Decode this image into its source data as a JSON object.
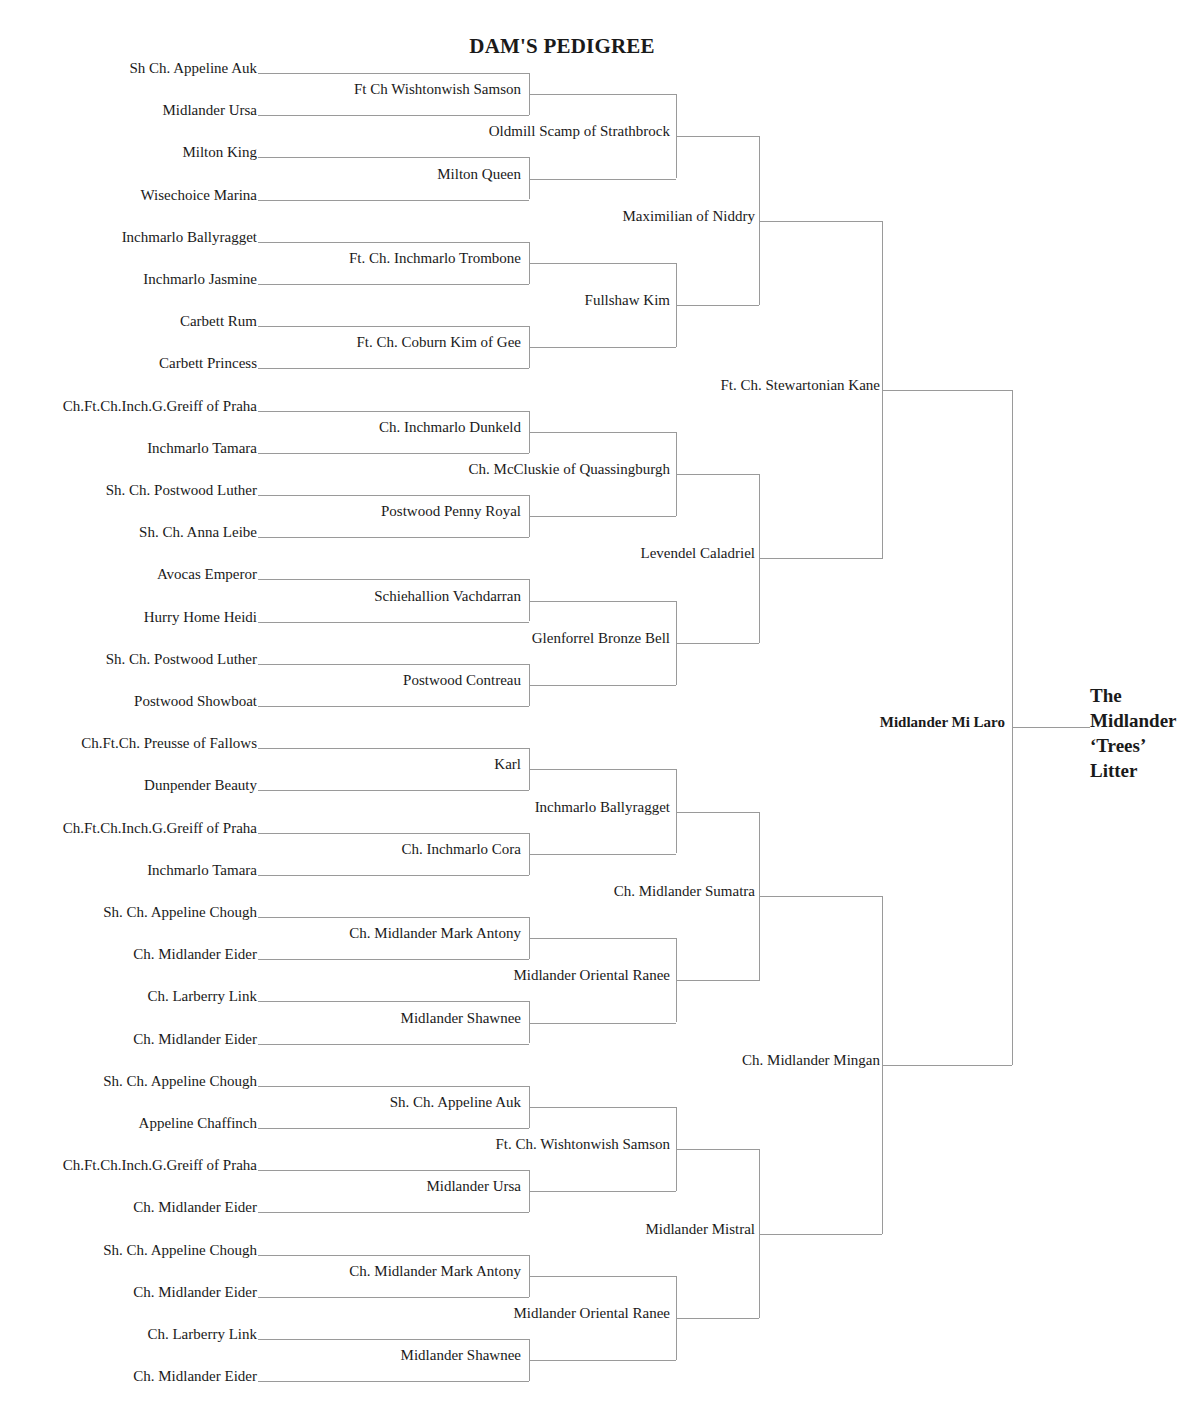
{
  "title": "DAM'S PEDIGREE",
  "litter": {
    "lines": [
      "The",
      "Midlander",
      "‘Trees’",
      "Litter"
    ]
  },
  "dam": "Midlander Mi Laro",
  "generations": {
    "gen1": [
      "Ft. Ch. Stewartonian Kane",
      "Ch. Midlander Mingan"
    ],
    "gen2": [
      "Maximilian of Niddry",
      "Levendel Caladriel",
      "Ch. Midlander Sumatra",
      "Midlander Mistral"
    ],
    "gen3": [
      "Oldmill Scamp of Strathbrock",
      "Fullshaw Kim",
      "Ch. McCluskie of Quassingburgh",
      "Glenforrel Bronze Bell",
      "Inchmarlo Ballyragget",
      "Midlander Oriental Ranee",
      "Ft. Ch. Wishtonwish Samson",
      "Midlander Oriental Ranee"
    ],
    "gen4": [
      "Ft  Ch  Wishtonwish Samson",
      "Milton Queen",
      "Ft. Ch. Inchmarlo Trombone",
      "Ft. Ch. Coburn Kim of Gee",
      "Ch. Inchmarlo Dunkeld",
      "Postwood Penny Royal",
      "Schiehallion Vachdarran",
      "Postwood Contreau",
      "Karl",
      "Ch. Inchmarlo Cora",
      "Ch. Midlander Mark Antony",
      "Midlander Shawnee",
      "Sh. Ch. Appeline Auk",
      "Midlander Ursa",
      "Ch. Midlander Mark Antony",
      "Midlander Shawnee"
    ],
    "gen5": [
      "Sh  Ch. Appeline Auk",
      "Midlander Ursa",
      "Milton King",
      "Wisechoice Marina",
      "Inchmarlo Ballyragget",
      "Inchmarlo Jasmine",
      "Carbett Rum",
      "Carbett Princess",
      "Ch.Ft.Ch.Inch.G.Greiff of Praha",
      "Inchmarlo Tamara",
      "Sh. Ch. Postwood Luther",
      "Sh. Ch. Anna Leibe",
      "Avocas Emperor",
      "Hurry Home Heidi",
      "Sh. Ch. Postwood Luther",
      "Postwood Showboat",
      "Ch.Ft.Ch. Preusse of Fallows",
      "Dunpender Beauty",
      "Ch.Ft.Ch.Inch.G.Greiff of Praha",
      "Inchmarlo Tamara",
      "Sh. Ch. Appeline Chough",
      "Ch. Midlander Eider",
      "Ch. Larberry Link",
      "Ch. Midlander Eider",
      "Sh. Ch. Appeline Chough",
      "Appeline Chaffinch",
      "Ch.Ft.Ch.Inch.G.Greiff of Praha",
      "Ch. Midlander Eider",
      "Sh. Ch. Appeline Chough",
      "Ch. Midlander Eider",
      "Ch. Larberry Link",
      "Ch. Midlander Eider"
    ]
  },
  "colors": {
    "line": "#9a9a9a",
    "text": "#1a1a1a",
    "background": "#ffffff"
  }
}
